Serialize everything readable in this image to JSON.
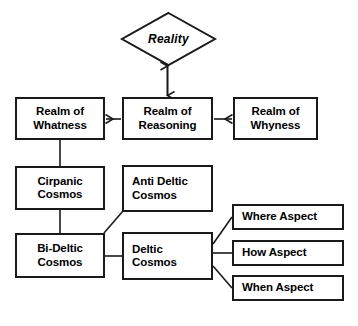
{
  "diagram": {
    "title_shape": {
      "name": "reality-diamond",
      "label": "Reality",
      "shape": "diamond"
    },
    "realms": [
      {
        "id": "realm-whatness",
        "line1": "Realm of",
        "line2": "Whatness",
        "align": "center"
      },
      {
        "id": "realm-reasoning",
        "line1": "Realm of",
        "line2": "Reasoning",
        "align": "center"
      },
      {
        "id": "realm-whyness",
        "line1": "Realm of",
        "line2": "Whyness",
        "align": "center"
      }
    ],
    "cosmos": [
      {
        "id": "cirpanic-cosmos",
        "line1": "Cirpanic",
        "line2": "Cosmos",
        "align": "center"
      },
      {
        "id": "anti-deltic-cosmos",
        "line1": "Anti Deltic",
        "line2": "Cosmos",
        "align": "left"
      },
      {
        "id": "bi-deltic-cosmos",
        "line1": "Bi-Deltic",
        "line2": "Cosmos",
        "align": "center"
      },
      {
        "id": "deltic-cosmos",
        "line1": "Deltic",
        "line2": "Cosmos",
        "align": "left"
      }
    ],
    "aspects": [
      {
        "id": "where-aspect",
        "label": "Where Aspect"
      },
      {
        "id": "how-aspect",
        "label": "How Aspect"
      },
      {
        "id": "when-aspect",
        "label": "When Aspect"
      }
    ],
    "colors": {
      "stroke": "#1a1a1a",
      "fill": "#ffffff",
      "text": "#000000"
    }
  }
}
